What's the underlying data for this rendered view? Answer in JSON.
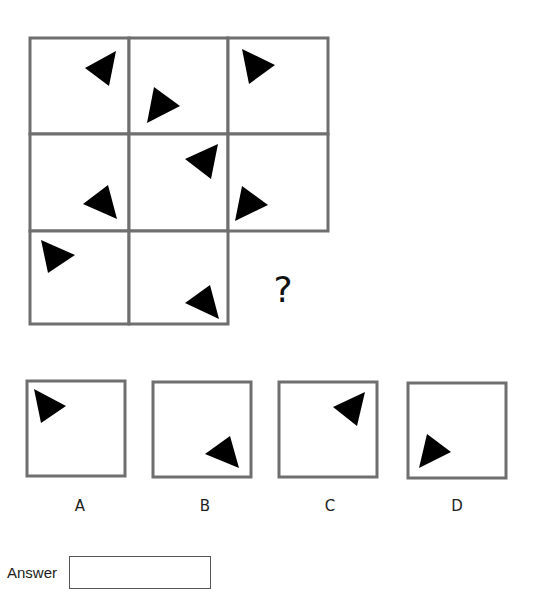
{
  "puzzle": {
    "question_mark": "?",
    "grid": {
      "cells": [
        {
          "row": 0,
          "col": 0,
          "x": 30,
          "y": 38,
          "w": 99,
          "h": 96,
          "triangle": [
            [
              85,
              68
            ],
            [
              116,
              51
            ],
            [
              109,
              86
            ]
          ]
        },
        {
          "row": 0,
          "col": 1,
          "x": 129,
          "y": 38,
          "w": 99,
          "h": 96,
          "triangle": [
            [
              154,
              87
            ],
            [
              180,
              106
            ],
            [
              147,
              123
            ]
          ]
        },
        {
          "row": 0,
          "col": 2,
          "x": 228,
          "y": 38,
          "w": 100,
          "h": 96,
          "triangle": [
            [
              242,
              49
            ],
            [
              275,
              65
            ],
            [
              249,
              84
            ]
          ]
        },
        {
          "row": 1,
          "col": 0,
          "x": 30,
          "y": 134,
          "w": 99,
          "h": 97,
          "triangle": [
            [
              83,
              204
            ],
            [
              108,
              185
            ],
            [
              117,
              219
            ]
          ]
        },
        {
          "row": 1,
          "col": 1,
          "x": 129,
          "y": 134,
          "w": 99,
          "h": 97,
          "triangle": [
            [
              185,
              159
            ],
            [
              218,
              144
            ],
            [
              211,
              179
            ]
          ]
        },
        {
          "row": 1,
          "col": 2,
          "x": 228,
          "y": 134,
          "w": 100,
          "h": 97,
          "triangle": [
            [
              242,
              186
            ],
            [
              268,
              205
            ],
            [
              235,
              221
            ]
          ]
        },
        {
          "row": 2,
          "col": 0,
          "x": 30,
          "y": 231,
          "w": 99,
          "h": 93,
          "triangle": [
            [
              41,
              240
            ],
            [
              75,
              255
            ],
            [
              48,
              273
            ]
          ]
        },
        {
          "row": 2,
          "col": 1,
          "x": 129,
          "y": 231,
          "w": 99,
          "h": 93,
          "triangle": [
            [
              185,
              303
            ],
            [
              210,
              285
            ],
            [
              219,
              319
            ]
          ]
        }
      ],
      "missing_cell": {
        "row": 2,
        "col": 2,
        "qmark_x": 283,
        "qmark_y": 302
      }
    },
    "options": [
      {
        "label": "A",
        "box": {
          "x": 27,
          "y": 381,
          "w": 98,
          "h": 95
        },
        "triangle": [
          [
            34,
            389
          ],
          [
            66,
            406
          ],
          [
            41,
            423
          ]
        ],
        "label_x": 80,
        "label_y": 511
      },
      {
        "label": "B",
        "box": {
          "x": 153,
          "y": 382,
          "w": 98,
          "h": 95
        },
        "triangle": [
          [
            205,
            454
          ],
          [
            230,
            436
          ],
          [
            239,
            468
          ]
        ],
        "label_x": 205,
        "label_y": 511
      },
      {
        "label": "C",
        "box": {
          "x": 279,
          "y": 382,
          "w": 98,
          "h": 95
        },
        "triangle": [
          [
            333,
            407
          ],
          [
            365,
            392
          ],
          [
            357,
            426
          ]
        ],
        "label_x": 330,
        "label_y": 511
      },
      {
        "label": "D",
        "box": {
          "x": 408,
          "y": 383,
          "w": 98,
          "h": 95
        },
        "triangle": [
          [
            427,
            434
          ],
          [
            451,
            452
          ],
          [
            419,
            468
          ]
        ],
        "label_x": 457,
        "label_y": 511
      }
    ]
  },
  "answer": {
    "label": "Answer",
    "value": "",
    "placeholder": ""
  },
  "colors": {
    "border": "#6f6f6f",
    "shape": "#000000",
    "background": "#ffffff"
  }
}
